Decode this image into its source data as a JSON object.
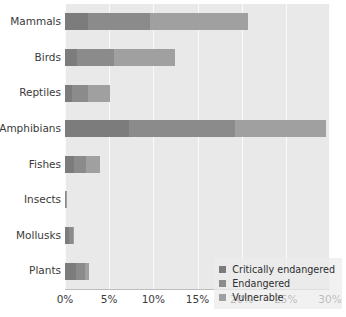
{
  "chart_data": {
    "type": "bar",
    "orientation": "horizontal",
    "stacked": true,
    "title": "",
    "subtitle": "",
    "xlabel": "",
    "ylabel": "",
    "xlim": [
      0,
      30
    ],
    "xunit": "%",
    "grid": true,
    "legend_position": "bottom-right inside plot",
    "categories": [
      "Mammals",
      "Birds",
      "Reptiles",
      "Amphibians",
      "Fishes",
      "Insects",
      "Mollusks",
      "Plants"
    ],
    "xticks": [
      0,
      5,
      10,
      15,
      20,
      25,
      30
    ],
    "xticklabels": [
      "0%",
      "5%",
      "10%",
      "15%",
      "20%",
      "25%",
      "30%"
    ],
    "series": [
      {
        "name": "Critically endangered",
        "color": "#7c7c7c",
        "values": [
          2.6,
          1.4,
          0.8,
          7.3,
          1.0,
          0.05,
          0.5,
          1.3
        ]
      },
      {
        "name": "Endangered",
        "color": "#8b8b8b",
        "values": [
          7.0,
          4.1,
          1.8,
          12.0,
          1.4,
          0.03,
          0.4,
          1.0
        ]
      },
      {
        "name": "Vulnerable",
        "color": "#a0a0a0",
        "values": [
          11.1,
          6.9,
          2.5,
          10.2,
          1.6,
          0.02,
          0.1,
          0.4
        ]
      }
    ],
    "totals": [
      20.7,
      12.4,
      5.1,
      29.5,
      4.0,
      0.1,
      1.0,
      2.7
    ],
    "plot_background": "#e9e9e9",
    "gridline_color": "#fbfbfb",
    "text_color": "#3a3a3a"
  },
  "legend": {
    "items": [
      {
        "label": "Critically endangered"
      },
      {
        "label": "Endangered"
      },
      {
        "label": "Vulnerable"
      }
    ]
  }
}
